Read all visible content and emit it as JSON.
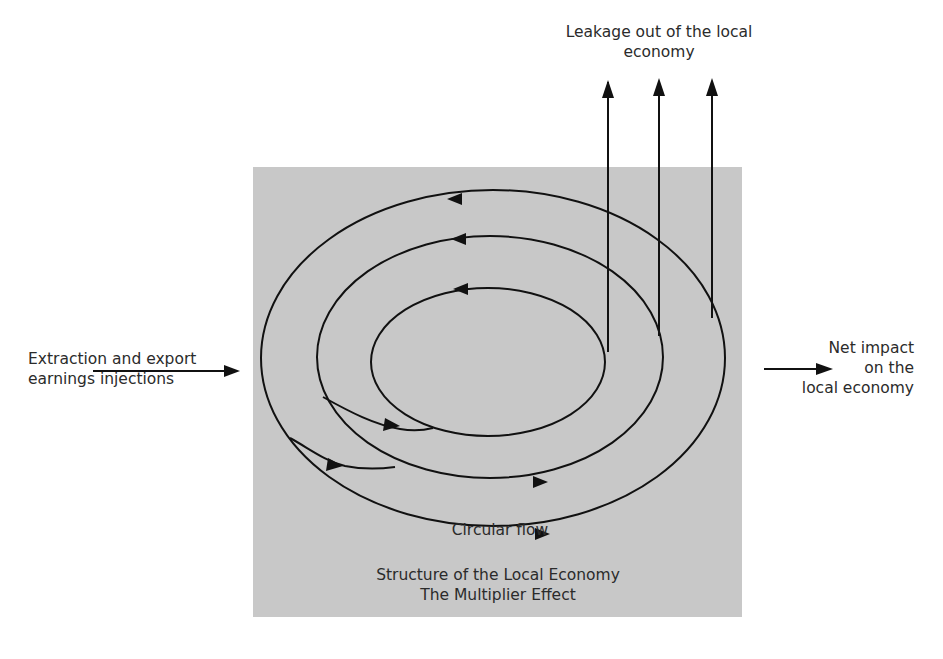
{
  "diagram": {
    "background_box_color": "#c8c8c8",
    "line_color": "#111111",
    "labels": {
      "leakage_line1": "Leakage out of the local",
      "leakage_line2": "economy",
      "injection_line1": "Extraction and export",
      "injection_line2": "earnings injections",
      "net_impact_line1": "Net impact",
      "net_impact_line2": "on the",
      "net_impact_line3": "local economy",
      "circular_flow": "Circular flow",
      "caption_line1": "Structure of the Local Economy",
      "caption_line2": "The Multiplier Effect"
    },
    "rings": [
      {
        "name": "inner",
        "cx": 488,
        "cy": 362,
        "rx": 117,
        "ry": 74
      },
      {
        "name": "middle",
        "cx": 490,
        "cy": 357,
        "rx": 172,
        "ry": 121
      },
      {
        "name": "outer",
        "cx": 493,
        "cy": 358,
        "rx": 232,
        "ry": 167
      }
    ],
    "leakage_arrows": 3
  }
}
